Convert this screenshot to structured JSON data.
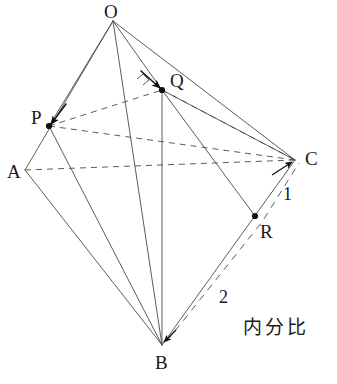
{
  "figure": {
    "type": "geometry-diagram",
    "canvas": {
      "width": 337,
      "height": 384,
      "background": "#ffffff"
    },
    "stroke_color": "#4a4a4a",
    "text_color": "#1a1a1a",
    "vertices": [
      {
        "id": "O",
        "label": "O",
        "x": 113,
        "y": 21,
        "label_x": 104,
        "label_y": 2,
        "dot": false
      },
      {
        "id": "A",
        "label": "A",
        "x": 25,
        "y": 170,
        "label_x": 7,
        "label_y": 162,
        "dot": false
      },
      {
        "id": "B",
        "label": "B",
        "x": 162,
        "y": 345,
        "label_x": 155,
        "label_y": 353,
        "dot": false
      },
      {
        "id": "C",
        "label": "C",
        "x": 295,
        "y": 160,
        "label_x": 305,
        "label_y": 149,
        "dot": false
      },
      {
        "id": "P",
        "label": "P",
        "x": 49,
        "y": 126,
        "label_x": 31,
        "label_y": 108,
        "dot": true
      },
      {
        "id": "Q",
        "label": "Q",
        "x": 162,
        "y": 90,
        "label_x": 170,
        "label_y": 71,
        "dot": true
      },
      {
        "id": "R",
        "label": "R",
        "x": 255,
        "y": 216,
        "label_x": 260,
        "label_y": 222,
        "dot": true
      }
    ],
    "solid_edges": [
      {
        "name": "edge-O-A",
        "from": "O",
        "to": "A"
      },
      {
        "name": "edge-O-P",
        "from": "O",
        "to": "P"
      },
      {
        "name": "edge-O-B",
        "from": "O",
        "to": "B"
      },
      {
        "name": "edge-O-Q",
        "from": "O",
        "to": "Q"
      },
      {
        "name": "edge-O-C",
        "from": "O",
        "to": "C"
      },
      {
        "name": "edge-A-B",
        "from": "A",
        "to": "B"
      },
      {
        "name": "edge-P-B",
        "from": "P",
        "to": "B"
      },
      {
        "name": "edge-Q-B",
        "from": "Q",
        "to": "B"
      },
      {
        "name": "edge-Q-C",
        "from": "Q",
        "to": "C"
      },
      {
        "name": "edge-Q-R",
        "from": "Q",
        "to": "R"
      },
      {
        "name": "edge-B-C",
        "from": "B",
        "to": "C"
      }
    ],
    "dashed_edges": [
      {
        "name": "edge-P-Q-dashed",
        "from": "P",
        "to": "Q"
      },
      {
        "name": "edge-P-C-dashed",
        "from": "P",
        "to": "C"
      },
      {
        "name": "edge-A-C-dashed",
        "from": "A",
        "to": "C"
      },
      {
        "name": "edge-Q-C-dashed",
        "from": "Q",
        "to": "C"
      }
    ],
    "ratio_path": {
      "name": "ratio-guide-B-R-C",
      "points": "167,341 262,222 299,163"
    },
    "arrows": [
      {
        "name": "arrow-to-P",
        "x1": 66,
        "y1": 104,
        "x2": 51,
        "y2": 124
      },
      {
        "name": "arrow-to-Q",
        "x1": 141,
        "y1": 71,
        "x2": 160,
        "y2": 88
      },
      {
        "name": "bracket-at-Q",
        "points": "137,79 143,74 149,80 143,85"
      }
    ],
    "ratio_labels": [
      {
        "name": "ratio-label-1",
        "text": "1",
        "x": 283,
        "y": 185
      },
      {
        "name": "ratio-label-2",
        "text": "2",
        "x": 219,
        "y": 288
      }
    ],
    "caption": {
      "name": "caption-naibunhi",
      "text": "内分比",
      "x": 243,
      "y": 318
    }
  }
}
